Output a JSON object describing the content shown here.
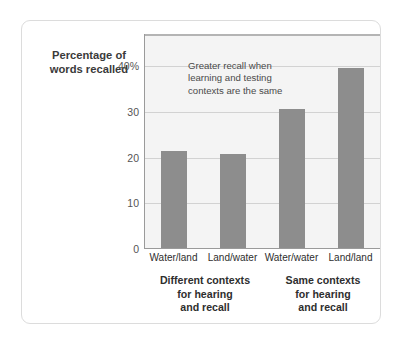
{
  "chart_data": {
    "type": "bar",
    "title": "",
    "xlabel": "",
    "ylabel": "Percentage of words recalled",
    "ylabel_lines": [
      "Percentage of",
      "words recalled"
    ],
    "categories": [
      "Water/land",
      "Land/water",
      "Water/water",
      "Land/land"
    ],
    "values": [
      21.5,
      20.7,
      30.6,
      39.5
    ],
    "ylim": [
      0,
      47
    ],
    "yticks": [
      0,
      10,
      20,
      30,
      40
    ],
    "ytick_labels": [
      "0",
      "10",
      "20",
      "30",
      "40%"
    ],
    "grid": true,
    "legend": "none",
    "bar_color": "#8d8d8d",
    "plot_background": "#f4f4f4",
    "annotations": [
      {
        "lines": [
          "Greater recall when",
          "learning and testing",
          "contexts are the same"
        ]
      }
    ],
    "group_labels": [
      {
        "lines": [
          "Different contexts",
          "for hearing",
          "and recall"
        ]
      },
      {
        "lines": [
          "Same contexts",
          "for hearing",
          "and recall"
        ]
      }
    ]
  }
}
